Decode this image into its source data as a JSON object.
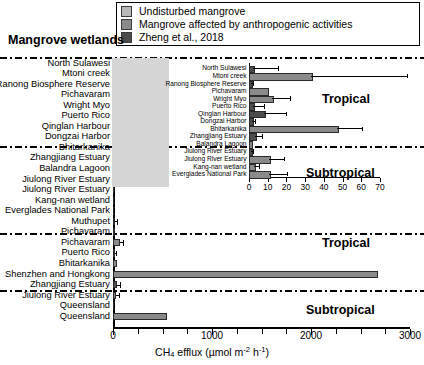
{
  "chart_title": "Mangrove wetlands",
  "legend": {
    "position": "top",
    "items": [
      {
        "label": "Undisturbed mangrove",
        "color": "#b8b8b8",
        "key": "undisturbed"
      },
      {
        "label": "Mangrove affected by anthropogenic activities",
        "color": "#8a8a8a",
        "key": "affected"
      },
      {
        "label": "Zheng et al., 2018",
        "color": "#4d4d4d",
        "key": "zheng"
      }
    ]
  },
  "axis": {
    "xlabel_parts": {
      "pre": "CH",
      "sub1": "4",
      "mid": " efflux (µmol m",
      "sup1": "-2",
      "mid2": " h",
      "sup2": "-1",
      "post": ")"
    },
    "xlabel_plain": "CH4 efflux (µmol m-2 h-1)",
    "main_ticks": [
      0,
      1000,
      2000,
      3000
    ],
    "main_minor_step": 250,
    "main_xlim": [
      0,
      3000
    ],
    "inset_ticks": [
      0,
      10,
      20,
      30,
      40,
      50,
      60,
      70
    ],
    "inset_xlim": [
      0,
      70
    ]
  },
  "zone_labels": [
    {
      "text": "Tropical",
      "group": "inset"
    },
    {
      "text": "Subtropical",
      "group": "inset"
    },
    {
      "text": "Tropical",
      "group": "main"
    },
    {
      "text": "Subtropical",
      "group": "main"
    }
  ],
  "chart_data": {
    "type": "bar",
    "orientation": "horizontal",
    "title": "Mangrove wetlands",
    "xlabel": "CH4 efflux (µmol m-2 h-1)",
    "ylabel": "",
    "xlim": [
      0,
      3000
    ],
    "grid": false,
    "legend_position": "top",
    "inset": {
      "xlim": [
        0,
        70
      ],
      "xticks": [
        0,
        10,
        20,
        30,
        40,
        50,
        60,
        70
      ],
      "note": "magnified view of the 0-70 range of the upper 15 sites"
    },
    "categories": [
      "North Sulawesi",
      "Mtoni creek",
      "Ranong Biosphere Reserve",
      "Pichavaram",
      "Wright Myo",
      "Puerto Rico",
      "Qinglan Harbour",
      "Dongzai Harbor",
      "Bhitarkanika",
      "Zhangjiang Estuary",
      "Balandra Lagoon",
      "Jiulong River Estuary",
      "Jiulong River Estuary",
      "Kang-nan wetland",
      "Everglades National Park",
      "Muthupet",
      "Pichavaram",
      "Pichavaram",
      "Puerto Rico",
      "Bhitarkanika",
      "Shenzhen and Hongkong",
      "Zhangjiang Estuary",
      "Jiulong River Estuary",
      "Queensland",
      "Queensland"
    ],
    "values": [
      2.1,
      33.0,
      0.8,
      9.5,
      12.5,
      2.4,
      8.2,
      1.6,
      47.0,
      3.4,
      0.2,
      1.2,
      10.5,
      2.6,
      10.8,
      25.0,
      18.0,
      66.0,
      22.0,
      40.0,
      2680.0,
      38.0,
      33.0,
      8.0,
      550.0
    ],
    "errors": [
      14.0,
      52.0,
      1.6,
      0.0,
      10.0,
      6.0,
      12.0,
      2.0,
      14.0,
      4.0,
      0.0,
      1.5,
      8.5,
      3.5,
      10.0,
      22.0,
      0.0,
      50.0,
      14.0,
      0.0,
      0.0,
      40.0,
      36.0,
      4.0,
      0.0
    ],
    "series_key": [
      "zheng",
      "affected",
      "zheng",
      "affected",
      "affected",
      "zheng",
      "zheng",
      "zheng",
      "affected",
      "zheng",
      "affected",
      "zheng",
      "affected",
      "affected",
      "affected",
      "affected",
      "affected",
      "affected",
      "affected",
      "affected",
      "affected",
      "zheng",
      "affected",
      "affected",
      "affected"
    ],
    "climate_zone": [
      "Tropical",
      "Tropical",
      "Tropical",
      "Tropical",
      "Tropical",
      "Tropical",
      "Tropical",
      "Tropical",
      "Tropical",
      "Subtropical",
      "Subtropical",
      "Subtropical",
      "Subtropical",
      "Subtropical",
      "Subtropical",
      "Tropical",
      "Tropical",
      "Tropical",
      "Tropical",
      "Tropical",
      "Tropical",
      "Subtropical",
      "Subtropical",
      "Subtropical",
      "Subtropical"
    ],
    "inset_rows": [
      0,
      1,
      2,
      3,
      4,
      5,
      6,
      7,
      8,
      9,
      10,
      11,
      12,
      13,
      14
    ]
  }
}
